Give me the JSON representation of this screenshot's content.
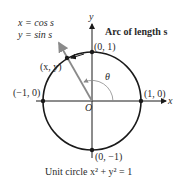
{
  "diagram": {
    "equations": {
      "line1": "x = cos s",
      "line2": "y = sin s"
    },
    "arc_label": "Arc of length s",
    "point_label": "(x, y)",
    "axes": {
      "x_label": "x",
      "y_label": "y",
      "origin_label": "O"
    },
    "angle_label": "θ",
    "points": [
      {
        "name": "top",
        "label": "(0, 1)"
      },
      {
        "name": "right",
        "label": "(1, 0)"
      },
      {
        "name": "left",
        "label": "(−1, 0)"
      },
      {
        "name": "bottom",
        "label": "(0, −1)"
      }
    ],
    "caption": "Unit circle x² + y² = 1",
    "colors": {
      "circle": "#1a1a1a",
      "axes": "#1a1a1a",
      "radius_arrow": "#8a8a8a",
      "arc_highlight": "#1a1a1a",
      "angle_arc": "#8a8a8a"
    }
  }
}
